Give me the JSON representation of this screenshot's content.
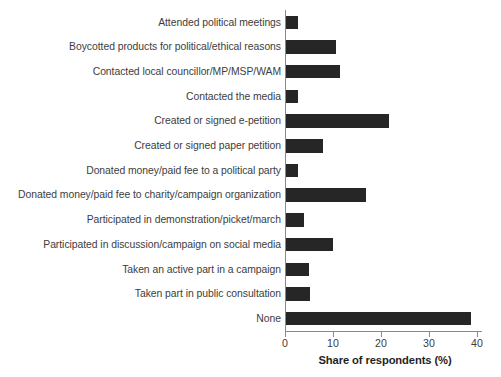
{
  "chart_data": {
    "type": "bar",
    "orientation": "horizontal",
    "title": "",
    "subtitle": "",
    "xlabel": "Share of respondents (%)",
    "ylabel": "",
    "xlim": [
      0,
      41
    ],
    "xticks": [
      0,
      10,
      20,
      30,
      40
    ],
    "xtick_labels": [
      "0",
      "10",
      "20",
      "30",
      "40"
    ],
    "grid": false,
    "legend": null,
    "bar_color": "#262626",
    "axis_color": "#8a8a8a",
    "text_color": "#3d3d3d",
    "categories": [
      "Attended political meetings",
      "Boycotted products for political/ethical reasons",
      "Contacted local councillor/MP/MSP/WAM",
      "Contacted the media",
      "Created or signed e-petition",
      "Created or signed paper petition",
      "Donated money/paid fee to a political party",
      "Donated money/paid fee to charity/campaign organization",
      "Participated in demonstration/picket/march",
      "Participated in discussion/campaign on social media",
      "Taken an active part in a campaign",
      "Taken part in public consultation",
      "None"
    ],
    "values": [
      2.6,
      10.4,
      11.2,
      2.6,
      21.5,
      7.8,
      2.5,
      16.7,
      3.7,
      9.8,
      4.7,
      4.9,
      38.6
    ]
  }
}
